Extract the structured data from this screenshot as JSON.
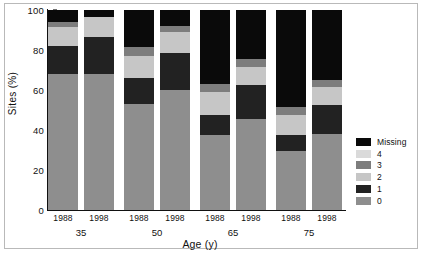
{
  "figure": {
    "background": "#ffffff",
    "border_color": "#b9b9b9"
  },
  "axes": {
    "y_title": "Sites (%)",
    "x_title": "Age (y)",
    "y_ticks": [
      "0",
      "20",
      "40",
      "60",
      "80",
      "100"
    ],
    "y_tick_values": [
      0,
      20,
      40,
      60,
      80,
      100
    ]
  },
  "legend": {
    "items": [
      {
        "label": "Missing",
        "color": "#0a0a0a"
      },
      {
        "label": "4",
        "color": "#dadada"
      },
      {
        "label": "3",
        "color": "#7d7d7d"
      },
      {
        "label": "2",
        "color": "#c6c6c6"
      },
      {
        "label": "1",
        "color": "#222222"
      },
      {
        "label": "0",
        "color": "#8e8e8e"
      }
    ]
  },
  "chart_data": {
    "type": "bar",
    "subtype": "stacked-100",
    "title": "",
    "xlabel": "Age (y)",
    "ylabel": "Sites (%)",
    "ylim": [
      0,
      100
    ],
    "yticks": [
      0,
      20,
      40,
      60,
      80,
      100
    ],
    "grid": false,
    "legend_position": "right",
    "group_label_name": "Age (y)",
    "groups": [
      "35",
      "50",
      "65",
      "75"
    ],
    "sub_categories": [
      "1988",
      "1998"
    ],
    "series_order_bottom_to_top": [
      "0",
      "1",
      "2",
      "3",
      "4",
      "Missing"
    ],
    "colors": {
      "0": "#8e8e8e",
      "1": "#222222",
      "2": "#c6c6c6",
      "3": "#7d7d7d",
      "4": "#dadada",
      "Missing": "#0a0a0a"
    },
    "bars": [
      {
        "group": "35",
        "year": "1988",
        "values": {
          "0": 68.0,
          "1": 14.0,
          "2": 9.5,
          "3": 2.5,
          "4": 0.0,
          "Missing": 6.0
        }
      },
      {
        "group": "35",
        "year": "1998",
        "values": {
          "0": 68.0,
          "1": 18.5,
          "2": 10.0,
          "3": 0.0,
          "4": 0.0,
          "Missing": 3.5
        }
      },
      {
        "group": "50",
        "year": "1988",
        "values": {
          "0": 53.0,
          "1": 13.0,
          "2": 11.0,
          "3": 4.5,
          "4": 0.0,
          "Missing": 18.5
        }
      },
      {
        "group": "50",
        "year": "1998",
        "values": {
          "0": 60.0,
          "1": 18.5,
          "2": 10.5,
          "3": 3.0,
          "4": 0.0,
          "Missing": 8.0
        }
      },
      {
        "group": "65",
        "year": "1988",
        "values": {
          "0": 37.5,
          "1": 10.0,
          "2": 11.5,
          "3": 4.0,
          "4": 0.0,
          "Missing": 37.0
        }
      },
      {
        "group": "65",
        "year": "1998",
        "values": {
          "0": 45.5,
          "1": 17.0,
          "2": 9.0,
          "3": 4.0,
          "4": 0.0,
          "Missing": 24.5
        }
      },
      {
        "group": "75",
        "year": "1988",
        "values": {
          "0": 29.5,
          "1": 8.0,
          "2": 10.0,
          "3": 4.0,
          "4": 0.0,
          "Missing": 48.5
        }
      },
      {
        "group": "75",
        "year": "1998",
        "values": {
          "0": 38.0,
          "1": 14.5,
          "2": 9.0,
          "3": 3.5,
          "4": 0.0,
          "Missing": 35.0
        }
      }
    ]
  }
}
